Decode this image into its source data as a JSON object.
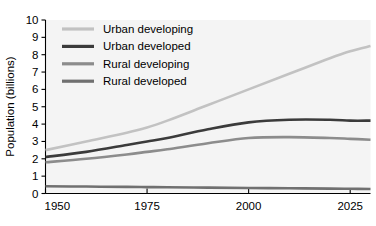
{
  "chart_data": {
    "type": "line",
    "title": "",
    "xlabel": "",
    "ylabel": "Population (billions)",
    "xlim": [
      1950,
      2030
    ],
    "ylim": [
      0,
      10
    ],
    "grid": false,
    "legend_position": "top-left inside plot",
    "x_ticks": [
      "1950",
      "1975",
      "2000",
      "2025"
    ],
    "x_tick_values": [
      1950,
      1975,
      2000,
      2025
    ],
    "y_ticks": [
      "0",
      "1",
      "2",
      "3",
      "4",
      "5",
      "6",
      "7",
      "8",
      "9",
      "10"
    ],
    "y_tick_values": [
      0,
      1,
      2,
      3,
      4,
      5,
      6,
      7,
      8,
      9,
      10
    ],
    "x": [
      1950,
      1960,
      1970,
      1975,
      1980,
      1990,
      2000,
      2010,
      2020,
      2025,
      2030
    ],
    "series": [
      {
        "name": "Urban developing",
        "color": "#c2c2c2",
        "values": [
          2.5,
          3.0,
          3.5,
          3.8,
          4.2,
          5.1,
          6.0,
          6.9,
          7.8,
          8.2,
          8.5
        ]
      },
      {
        "name": "Urban developed",
        "color": "#3b3b3b",
        "values": [
          2.1,
          2.4,
          2.8,
          3.0,
          3.2,
          3.7,
          4.1,
          4.25,
          4.25,
          4.2,
          4.2
        ]
      },
      {
        "name": "Rural developing",
        "color": "#8c8c8c",
        "values": [
          1.8,
          2.0,
          2.25,
          2.4,
          2.55,
          2.9,
          3.2,
          3.25,
          3.2,
          3.15,
          3.1
        ]
      },
      {
        "name": "Rural developed",
        "color": "#707070",
        "values": [
          0.42,
          0.4,
          0.38,
          0.37,
          0.36,
          0.34,
          0.32,
          0.3,
          0.28,
          0.27,
          0.26
        ]
      }
    ]
  },
  "legend": {
    "entries": [
      {
        "label": "Urban developing",
        "color": "#c2c2c2"
      },
      {
        "label": "Urban developed",
        "color": "#3b3b3b"
      },
      {
        "label": "Rural developing",
        "color": "#8c8c8c"
      },
      {
        "label": "Rural developed",
        "color": "#707070"
      }
    ]
  },
  "axes": {
    "y_axis_title": "Population (billions)"
  }
}
